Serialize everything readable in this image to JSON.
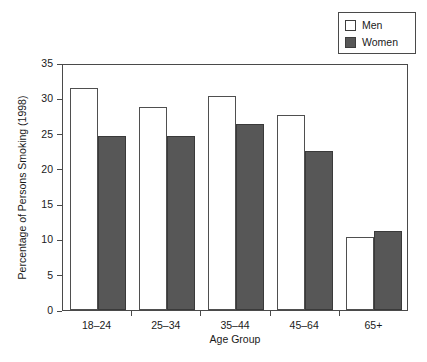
{
  "chart_data": {
    "type": "bar",
    "title": "",
    "subtitle": "",
    "xlabel": "Age Group",
    "ylabel": "Percentage of Persons Smoking (1998)",
    "categories": [
      "18–24",
      "25–34",
      "35–44",
      "45–64",
      "65+"
    ],
    "series": [
      {
        "name": "Men",
        "values": [
          31.5,
          28.7,
          30.3,
          27.6,
          10.4
        ],
        "color": "#ffffff",
        "edge_color": "#4f4f4f"
      },
      {
        "name": "Women",
        "values": [
          24.6,
          24.7,
          26.4,
          22.6,
          11.2
        ],
        "color": "#575757",
        "edge_color": "#3a3a3a"
      }
    ],
    "ylim": [
      0,
      35
    ],
    "yticks": [
      0,
      5,
      10,
      15,
      20,
      25,
      30,
      35
    ],
    "ytick_labels": [
      "0",
      "5",
      "10",
      "15",
      "20",
      "25",
      "30",
      "35"
    ],
    "xtick_labels": [
      "18–24",
      "25–34",
      "35–44",
      "45–64",
      "65+"
    ],
    "grid": false,
    "legend_position": "top-right",
    "legend_entries": [
      {
        "label": "Men",
        "swatch": "men"
      },
      {
        "label": "Women",
        "swatch": "women"
      }
    ]
  },
  "axes": {
    "y_title": "Percentage of Persons Smoking (1998)",
    "x_title": "Age Group"
  },
  "legend": {
    "men_label": "Men",
    "women_label": "Women"
  }
}
